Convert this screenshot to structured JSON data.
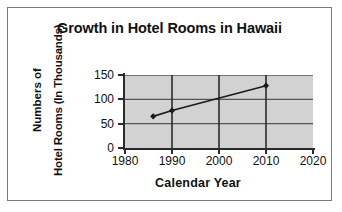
{
  "chart_data": {
    "type": "line",
    "title": "Growth in Hotel Rooms in Hawaii",
    "xlabel": "Calendar Year",
    "ylabel_line1": "Numbers of",
    "ylabel_line2": "Hotel Rooms (In Thousands)",
    "xlim": [
      1980,
      2020
    ],
    "ylim": [
      0,
      150
    ],
    "xticks": [
      "1980",
      "1990",
      "2000",
      "2010",
      "2020"
    ],
    "xtick_values": [
      1980,
      1990,
      2000,
      2010,
      2020
    ],
    "yticks": [
      "0",
      "50",
      "100",
      "150"
    ],
    "ytick_values": [
      0,
      50,
      100,
      150
    ],
    "grid": "both",
    "legend": "none",
    "marker": "diamond",
    "series": [
      {
        "name": "Hotel Rooms",
        "x": [
          1986,
          1990,
          2010
        ],
        "values": [
          65,
          77,
          128
        ],
        "points": [
          {
            "year": 1986,
            "rooms": 65
          },
          {
            "year": 1990,
            "rooms": 77
          },
          {
            "year": 2010,
            "rooms": 128
          }
        ]
      }
    ],
    "colors": {
      "plot_background": "#d2d2d2",
      "line": "#1a1a1a",
      "grid": "#555555",
      "axis": "#2b2b2b",
      "text": "#111111",
      "frame_border": "#7a7a7a"
    }
  }
}
